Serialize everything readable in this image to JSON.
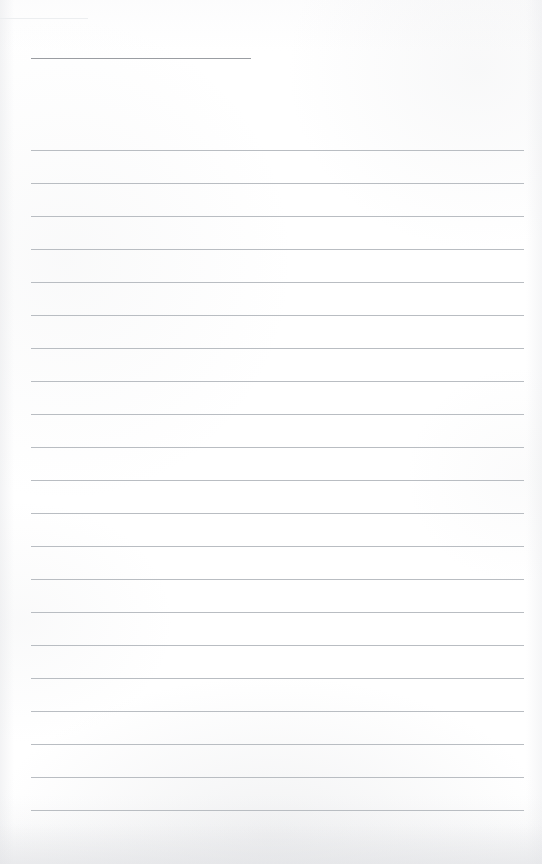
{
  "document": {
    "kind": "lined-notebook-page",
    "title_text": "",
    "body_text": "",
    "page_width": 542,
    "page_height": 864,
    "background_color": "#ffffff",
    "rule_color": "#b9bdc2",
    "title_rule_color": "#9a9da2",
    "ghost_rule_color": "#eceef0"
  },
  "title_rule": {
    "label": "title-rule",
    "x": 31,
    "y": 58,
    "width": 220,
    "thickness": 1
  },
  "ghost_rule": {
    "label": "ghost-rule",
    "x": 0,
    "y": 18,
    "width": 88,
    "thickness": 1
  },
  "ruling": {
    "label": "ruled-lines",
    "left": 31,
    "right": 524,
    "width": 493,
    "first_y": 150,
    "spacing": 33,
    "count": 21,
    "thickness": 1,
    "lines": [
      {
        "index": 1,
        "y": 150,
        "content": ""
      },
      {
        "index": 2,
        "y": 183,
        "content": ""
      },
      {
        "index": 3,
        "y": 216,
        "content": ""
      },
      {
        "index": 4,
        "y": 249,
        "content": ""
      },
      {
        "index": 5,
        "y": 282,
        "content": ""
      },
      {
        "index": 6,
        "y": 315,
        "content": ""
      },
      {
        "index": 7,
        "y": 348,
        "content": ""
      },
      {
        "index": 8,
        "y": 381,
        "content": ""
      },
      {
        "index": 9,
        "y": 414,
        "content": ""
      },
      {
        "index": 10,
        "y": 447,
        "content": ""
      },
      {
        "index": 11,
        "y": 480,
        "content": ""
      },
      {
        "index": 12,
        "y": 513,
        "content": ""
      },
      {
        "index": 13,
        "y": 546,
        "content": ""
      },
      {
        "index": 14,
        "y": 579,
        "content": ""
      },
      {
        "index": 15,
        "y": 612,
        "content": ""
      },
      {
        "index": 16,
        "y": 645,
        "content": ""
      },
      {
        "index": 17,
        "y": 678,
        "content": ""
      },
      {
        "index": 18,
        "y": 711,
        "content": ""
      },
      {
        "index": 19,
        "y": 744,
        "content": ""
      },
      {
        "index": 20,
        "y": 777,
        "content": ""
      },
      {
        "index": 21,
        "y": 810,
        "content": ""
      }
    ]
  }
}
